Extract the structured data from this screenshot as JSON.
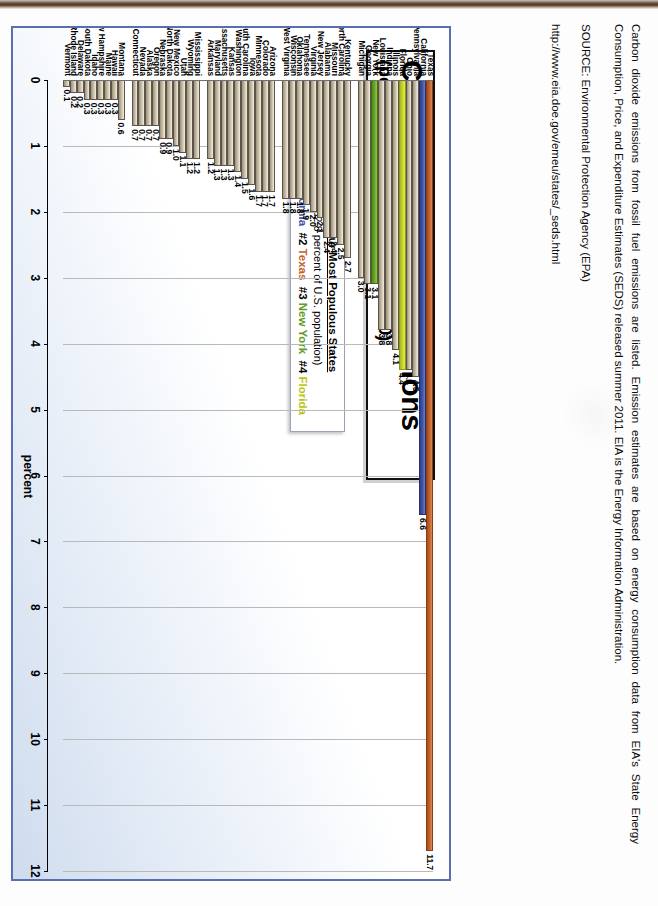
{
  "document": {
    "kind": "scanned-slide",
    "orientation": "rotated-90-clockwise"
  },
  "slide": {
    "title_line1": "Carbon Dioxide Emissions",
    "title_line2": "(percent of nation's total in 2010)",
    "legend": {
      "heading": "The Four Most Populous States",
      "subheading": "(32.8 percent of U.S. population)",
      "entries": [
        {
          "rank": "#1",
          "state": "California",
          "color": "#3f53a8"
        },
        {
          "rank": "#2",
          "state": "Texas",
          "color": "#c4622c"
        },
        {
          "rank": "#3",
          "state": "New York",
          "color": "#5f9c22"
        },
        {
          "rank": "#4",
          "state": "Florida",
          "color": "#b9c516"
        }
      ]
    }
  },
  "notes": {
    "paragraph1": "Carbon dioxide emissions from fossil fuel emissions are listed. Emission estimates are based on energy consumption data from EIA's State Energy Consumption, Price, and Expenditure Estimates (SEDS) released summer 2011. EIA is the Energy Information Administration.",
    "paragraph2": "SOURCE: Environmental Protection Agency (EPA)",
    "paragraph3": "http://www.eia.doe.gov/emeu/states/_seds.html"
  },
  "chart_data": {
    "type": "bar",
    "orientation": "horizontal",
    "title": "Carbon Dioxide Emissions",
    "subtitle": "(percent of nation's total in 2010)",
    "xlabel": "percent",
    "ylabel": "",
    "xlim": [
      0,
      12
    ],
    "xticks": [
      0,
      1,
      2,
      3,
      4,
      5,
      6,
      7,
      8,
      9,
      10,
      11,
      12
    ],
    "grid": true,
    "legend_position": "none",
    "default_bar_color": "#c9bfa8",
    "categories": [
      "Texas",
      "California",
      "Pennsylvania",
      "Ohio",
      "Florida",
      "Illinois",
      "Indiana",
      "Louisiana",
      "New York",
      "Georgia",
      "Michigan",
      "Kentucky",
      "North Carolina",
      "Missouri",
      "Alabama",
      "New Jersey",
      "Virginia",
      "Tennessee",
      "Oklahoma",
      "Wisconsin",
      "West Virginia",
      "Arizona",
      "Colorado",
      "Minnesota",
      "Iowa",
      "South Carolina",
      "Washington",
      "Kansas",
      "Massachusetts",
      "Maryland",
      "Arkansas",
      "Mississippi",
      "Wyoming",
      "Utah",
      "New Mexico",
      "North Dakota",
      "Nebraska",
      "Oregon",
      "Alaska",
      "Nevada",
      "Connecticut",
      "Montana",
      "Hawaii",
      "Maine",
      "New Hampshire",
      "Idaho",
      "South Dakota",
      "Delaware",
      "Rhode Island",
      "Vermont"
    ],
    "values": [
      11.7,
      6.6,
      4.5,
      4.4,
      4.4,
      4.1,
      3.8,
      3.8,
      3.1,
      3.1,
      3.0,
      2.7,
      2.5,
      2.4,
      2.4,
      2.1,
      2.0,
      1.9,
      1.8,
      1.8,
      1.8,
      1.7,
      1.7,
      1.7,
      1.6,
      1.5,
      1.4,
      1.3,
      1.3,
      1.3,
      1.2,
      1.2,
      1.2,
      1.1,
      1.0,
      0.9,
      0.9,
      0.7,
      0.7,
      0.7,
      0.7,
      0.6,
      0.3,
      0.3,
      0.3,
      0.3,
      0.3,
      0.2,
      0.2,
      0.1
    ],
    "labels": [
      "11.7",
      "6.6",
      "4.5",
      "4.4",
      "4.4",
      "4.1",
      "3.8",
      "3.8",
      "3.1",
      "3.1",
      "3.0",
      "2.7",
      "2.5",
      "2.4",
      "2.4",
      "2.1",
      "2.0",
      "1.9",
      "1.8",
      "1.8",
      "1.8",
      "1.7",
      "1.7",
      "1.7",
      "1.6",
      "1.5",
      "1.4",
      "1.3",
      "1.3",
      "1.3",
      "1.2",
      "1.2",
      "1.2",
      "1.1",
      "1.0",
      "0.9",
      "0.9",
      "0.7",
      "0.7",
      "0.7",
      "0.7",
      "0.6",
      "0.3",
      "0.3",
      "0.3",
      "0.3",
      "0.3",
      "0.2",
      "0.2",
      "0.1"
    ],
    "colors": [
      "orange",
      "blue",
      "tan",
      "tan",
      "yellow",
      "tan",
      "tan",
      "tan",
      "green",
      "tan",
      "tan",
      "tan",
      "tan",
      "tan",
      "tan",
      "tan",
      "tan",
      "tan",
      "tan",
      "tan",
      "tan",
      "tan",
      "tan",
      "tan",
      "tan",
      "tan",
      "tan",
      "tan",
      "tan",
      "tan",
      "tan",
      "tan",
      "tan",
      "tan",
      "tan",
      "tan",
      "tan",
      "tan",
      "tan",
      "tan",
      "tan",
      "tan",
      "tan",
      "tan",
      "tan",
      "tan",
      "tan",
      "tan",
      "tan",
      "tan"
    ],
    "group_breaks_after": [
      "Michigan",
      "West Virginia",
      "Arkansas",
      "Connecticut"
    ]
  }
}
